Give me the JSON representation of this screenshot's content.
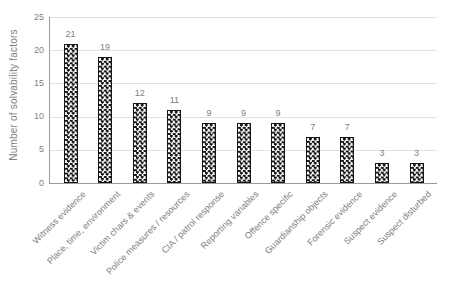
{
  "chart_data": {
    "type": "bar",
    "title": "",
    "ylabel": "Number of solvability factors",
    "xlabel": "",
    "categories": [
      "Witness evidence",
      "Place, time, environment",
      "Victim chars & events",
      "Police measures / resources",
      "CIA / patrol response",
      "Reporting variables",
      "Offence specific",
      "Guardianship objects",
      "Forensic evidence",
      "Suspect evidence",
      "Suspect disturbed"
    ],
    "values": [
      21,
      19,
      12,
      11,
      9,
      9,
      9,
      7,
      7,
      3,
      3
    ],
    "ylim": [
      0,
      25
    ],
    "yticks": [
      0,
      5,
      10,
      15,
      20,
      25
    ],
    "grid": true,
    "legend": "none",
    "bar_style": {
      "pattern": "checkerboard",
      "fill_dark": "#151515",
      "fill_light": "#ffffff"
    },
    "colors": {
      "text": "#808080",
      "gridline": "#e2e2e2",
      "axis": "#9a9a9a"
    }
  }
}
